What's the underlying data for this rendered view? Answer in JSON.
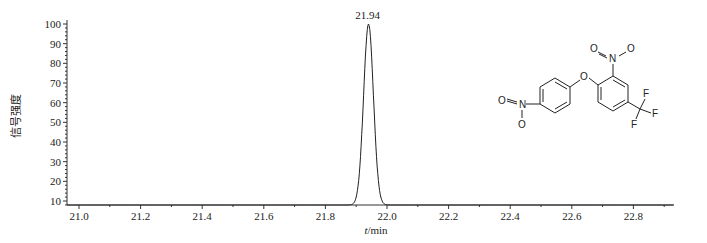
{
  "chart_data": {
    "type": "line",
    "title": "",
    "xlabel": "t/min",
    "ylabel": "信号强度",
    "xlim": [
      20.96,
      22.93
    ],
    "ylim": [
      5,
      100
    ],
    "x_ticks": [
      21.0,
      21.2,
      21.4,
      21.6,
      21.8,
      22.0,
      22.2,
      22.4,
      22.6,
      22.8
    ],
    "x_tick_labels": [
      "21.0",
      "21.2",
      "21.4",
      "21.6",
      "21.8",
      "22.0",
      "22.2",
      "22.4",
      "22.6",
      "22.8"
    ],
    "y_ticks": [
      10,
      20,
      30,
      40,
      50,
      60,
      70,
      80,
      90,
      100
    ],
    "y_tick_labels": [
      "10",
      "20",
      "30",
      "40",
      "50",
      "60",
      "70",
      "80",
      "90",
      "100"
    ],
    "grid": false,
    "legend": null,
    "series": [
      {
        "name": "chromatogram",
        "x": [
          20.96,
          21.9,
          21.91,
          21.92,
          21.93,
          21.94,
          21.95,
          21.96,
          21.97,
          21.98,
          22.93
        ],
        "y": [
          5,
          5,
          15,
          55,
          90,
          100,
          90,
          55,
          15,
          5,
          5
        ]
      }
    ],
    "annotations": [
      {
        "text": "21.94",
        "x": 21.94,
        "y": 100,
        "type": "peak_label"
      }
    ],
    "inset": {
      "type": "chemical_structure",
      "atoms": [
        "O",
        "N",
        "O",
        "O",
        "N",
        "O",
        "F",
        "F",
        "F"
      ],
      "description": "nitrophenyl ether with nitro and trifluoromethyl substituents"
    }
  }
}
